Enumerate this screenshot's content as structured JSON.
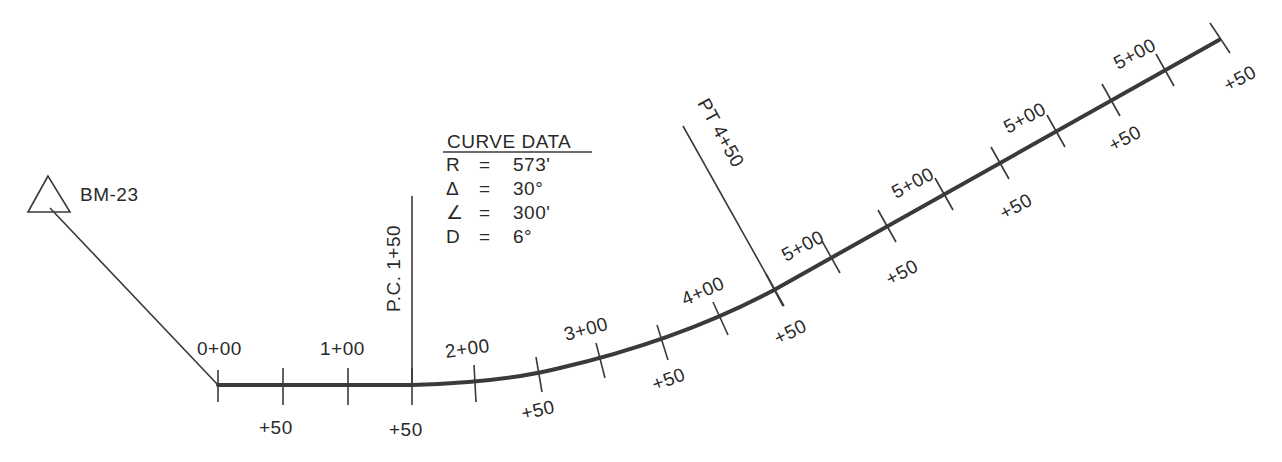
{
  "benchmark": {
    "label": "BM-23",
    "icon": "triangle-benchmark-icon"
  },
  "curve_data": {
    "title": "CURVE DATA",
    "rows": [
      {
        "symbol": "R",
        "eq": "=",
        "value": "573'"
      },
      {
        "symbol": "Δ",
        "eq": "=",
        "value": "30°"
      },
      {
        "symbol": "∠",
        "eq": "=",
        "value": "300'"
      },
      {
        "symbol": "D",
        "eq": "=",
        "value": "6°"
      }
    ]
  },
  "pc_marker": {
    "label": "P.C.  1+50"
  },
  "pt_marker": {
    "label": "PT  4+50"
  },
  "stations": {
    "major": [
      "0+00",
      "1+00",
      "2+00",
      "3+00",
      "4+00",
      "5+00",
      "5+00",
      "5+00",
      "5+00"
    ],
    "half": [
      "+50",
      "+50",
      "+50",
      "+50",
      "+50",
      "+50",
      "+50",
      "+50",
      "+50"
    ]
  },
  "colors": {
    "line": "#3a3a3a",
    "text": "#2a2a2a",
    "background": "#ffffff"
  }
}
